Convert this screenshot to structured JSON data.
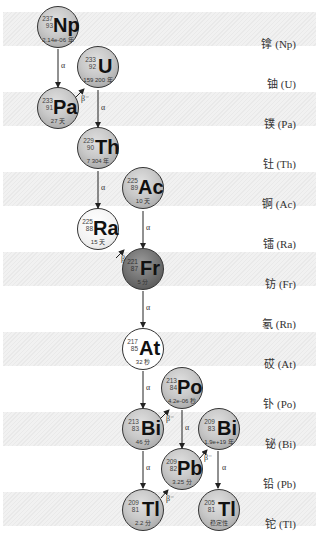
{
  "rows": [
    {
      "label": "镎 (Np)",
      "shaded": true
    },
    {
      "label": "铀 (U)",
      "shaded": false
    },
    {
      "label": "镤 (Pa)",
      "shaded": true
    },
    {
      "label": "钍 (Th)",
      "shaded": false
    },
    {
      "label": "锕 (Ac)",
      "shaded": true
    },
    {
      "label": "镭 (Ra)",
      "shaded": false
    },
    {
      "label": "钫 (Fr)",
      "shaded": true
    },
    {
      "label": "氡 (Rn)",
      "shaded": false
    },
    {
      "label": "砹 (At)",
      "shaded": true
    },
    {
      "label": "钋 (Po)",
      "shaded": false
    },
    {
      "label": "铋 (Bi)",
      "shaded": true
    },
    {
      "label": "铅 (Pb)",
      "shaded": false
    },
    {
      "label": "铊 (Tl)",
      "shaded": true
    }
  ],
  "nuclides": {
    "np237": {
      "symbol": "Np",
      "mass": "237",
      "z": "93",
      "half_life": "2.14e-06 年"
    },
    "u233": {
      "symbol": "U",
      "mass": "233",
      "z": "92",
      "half_life": "159 200 年"
    },
    "pa233": {
      "symbol": "Pa",
      "mass": "233",
      "z": "91",
      "half_life": "27 天"
    },
    "th229": {
      "symbol": "Th",
      "mass": "229",
      "z": "90",
      "half_life": "7 304 年"
    },
    "ac225": {
      "symbol": "Ac",
      "mass": "225",
      "z": "89",
      "half_life": "10 天"
    },
    "ra225": {
      "symbol": "Ra",
      "mass": "225",
      "z": "88",
      "half_life": "15 天"
    },
    "fr221": {
      "symbol": "Fr",
      "mass": "221",
      "z": "87",
      "half_life": "5 分"
    },
    "at217": {
      "symbol": "At",
      "mass": "217",
      "z": "85",
      "half_life": "32 秒"
    },
    "po213": {
      "symbol": "Po",
      "mass": "213",
      "z": "84",
      "half_life": "4.2e-06 秒"
    },
    "bi213": {
      "symbol": "Bi",
      "mass": "213",
      "z": "83",
      "half_life": "46 分"
    },
    "bi209": {
      "symbol": "Bi",
      "mass": "209",
      "z": "83",
      "half_life": "1.9e+19 年"
    },
    "pb209": {
      "symbol": "Pb",
      "mass": "209",
      "z": "82",
      "half_life": "3.25 分"
    },
    "tl209": {
      "symbol": "Tl",
      "mass": "209",
      "z": "81",
      "half_life": "2.2 分"
    },
    "tl205": {
      "symbol": "Tl",
      "mass": "205",
      "z": "81",
      "half_life": "稳定性"
    }
  },
  "decay_labels": {
    "alpha": "α",
    "beta": "β⁻"
  }
}
